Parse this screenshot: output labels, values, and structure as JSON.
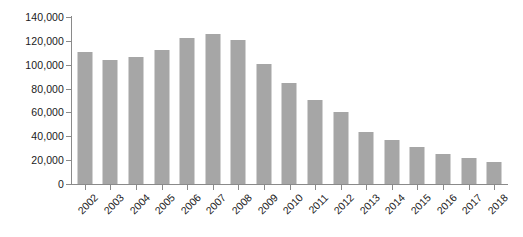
{
  "chart_data": {
    "type": "bar",
    "title": "",
    "subtitle": "",
    "xlabel": "",
    "ylabel": "",
    "categories": [
      "2002",
      "2003",
      "2004",
      "2005",
      "2006",
      "2007",
      "2008",
      "2009",
      "2010",
      "2011",
      "2012",
      "2013",
      "2014",
      "2015",
      "2016",
      "2017",
      "2018"
    ],
    "values": [
      111000,
      104000,
      106500,
      112000,
      122500,
      126000,
      120500,
      101000,
      85000,
      70500,
      60500,
      44000,
      37000,
      31000,
      25500,
      21500,
      18500
    ],
    "series": [
      {
        "name": "",
        "values": [
          111000,
          104000,
          106500,
          112000,
          122500,
          126000,
          120500,
          101000,
          85000,
          70500,
          60500,
          44000,
          37000,
          31000,
          25500,
          21500,
          18500
        ]
      }
    ],
    "ylim": [
      0,
      140000
    ],
    "ytick_values": [
      0,
      20000,
      40000,
      60000,
      80000,
      100000,
      120000,
      140000
    ],
    "ytick_labels": [
      "0",
      "20,000",
      "40,000",
      "60,000",
      "80,000",
      "100,000",
      "120,000",
      "140,000"
    ],
    "grid": false,
    "legend": false,
    "legend_position": "none",
    "bar_color": "#a6a6a6",
    "axis_color": "#8a8a8a",
    "text_color": "#1a1a1a",
    "xtick_rotation": -45,
    "background": "#ffffff"
  }
}
